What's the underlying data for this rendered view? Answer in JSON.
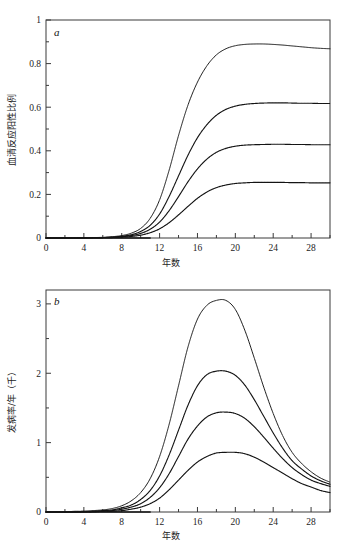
{
  "figure": {
    "panels": [
      {
        "letter": "a",
        "xlabel": "年数",
        "ylabel": "血清反应阳性比例"
      },
      {
        "letter": "b",
        "xlabel": "年数",
        "ylabel": "发病率/年（千）"
      }
    ]
  },
  "chart_data": [
    {
      "type": "line",
      "panel": "a",
      "title": "",
      "xlabel": "年数",
      "ylabel": "血清反应阳性比例",
      "xlim": [
        0,
        30
      ],
      "ylim": [
        0,
        1
      ],
      "xticks": [
        0,
        4,
        8,
        12,
        16,
        20,
        24,
        28
      ],
      "yticks": [
        0,
        0.2,
        0.4,
        0.6,
        0.8,
        1
      ],
      "xtick_labels": [
        "0",
        "4",
        "8",
        "12",
        "16",
        "20",
        "24",
        "28"
      ],
      "ytick_labels": [
        "0",
        "0.2",
        "0.4",
        "0.6",
        "0.8",
        "1"
      ],
      "minor_ticks": true,
      "grid": false,
      "legend": "none",
      "marker_style": "dense-dotted",
      "x": [
        0,
        1,
        2,
        3,
        4,
        5,
        6,
        7,
        8,
        9,
        10,
        11,
        12,
        13,
        14,
        15,
        16,
        17,
        18,
        19,
        20,
        21,
        22,
        23,
        24,
        25,
        26,
        27,
        28,
        29,
        30
      ],
      "series": [
        {
          "name": "curve-1",
          "description": "highest seroprevalence plateau",
          "plateau": 0.89,
          "end_value": 0.87,
          "values": [
            0.0,
            0.0,
            0.0,
            0.0,
            0.001,
            0.002,
            0.003,
            0.006,
            0.011,
            0.022,
            0.044,
            0.09,
            0.175,
            0.31,
            0.47,
            0.61,
            0.715,
            0.79,
            0.84,
            0.868,
            0.882,
            0.888,
            0.89,
            0.89,
            0.888,
            0.885,
            0.881,
            0.877,
            0.873,
            0.87,
            0.868
          ]
        },
        {
          "name": "curve-2",
          "description": "second seroprevalence plateau",
          "plateau": 0.62,
          "end_value": 0.617,
          "values": [
            0.0,
            0.0,
            0.0,
            0.0,
            0.001,
            0.001,
            0.002,
            0.004,
            0.008,
            0.015,
            0.03,
            0.058,
            0.11,
            0.19,
            0.285,
            0.38,
            0.46,
            0.52,
            0.563,
            0.59,
            0.605,
            0.613,
            0.617,
            0.619,
            0.62,
            0.62,
            0.619,
            0.618,
            0.618,
            0.617,
            0.617
          ]
        },
        {
          "name": "curve-3",
          "description": "third seroprevalence plateau",
          "plateau": 0.43,
          "end_value": 0.428,
          "values": [
            0.0,
            0.0,
            0.0,
            0.0,
            0.0,
            0.001,
            0.002,
            0.003,
            0.006,
            0.011,
            0.021,
            0.04,
            0.073,
            0.125,
            0.19,
            0.258,
            0.317,
            0.362,
            0.393,
            0.411,
            0.421,
            0.426,
            0.428,
            0.429,
            0.43,
            0.43,
            0.429,
            0.429,
            0.428,
            0.428,
            0.428
          ]
        },
        {
          "name": "curve-4",
          "description": "lowest seroprevalence plateau",
          "plateau": 0.255,
          "end_value": 0.253,
          "values": [
            0.0,
            0.0,
            0.0,
            0.0,
            0.0,
            0.0,
            0.001,
            0.002,
            0.004,
            0.007,
            0.013,
            0.024,
            0.042,
            0.07,
            0.106,
            0.145,
            0.182,
            0.211,
            0.231,
            0.243,
            0.25,
            0.253,
            0.255,
            0.255,
            0.255,
            0.255,
            0.254,
            0.254,
            0.253,
            0.253,
            0.253
          ]
        }
      ]
    },
    {
      "type": "line",
      "panel": "b",
      "title": "",
      "xlabel": "年数",
      "ylabel": "发病率/年（千）",
      "xlim": [
        0,
        30
      ],
      "ylim": [
        0,
        3.2
      ],
      "xticks": [
        0,
        4,
        8,
        12,
        16,
        20,
        24,
        28
      ],
      "yticks": [
        0,
        1,
        2,
        3
      ],
      "xtick_labels": [
        "0",
        "4",
        "8",
        "12",
        "16",
        "20",
        "24",
        "28"
      ],
      "ytick_labels": [
        "0",
        "1",
        "2",
        "3"
      ],
      "minor_ticks": true,
      "grid": false,
      "legend": "none",
      "marker_style": "dense-dotted",
      "x": [
        0,
        1,
        2,
        3,
        4,
        5,
        6,
        7,
        8,
        9,
        10,
        11,
        12,
        13,
        14,
        15,
        16,
        17,
        18,
        19,
        20,
        21,
        22,
        23,
        24,
        25,
        26,
        27,
        28,
        29,
        30
      ],
      "series": [
        {
          "name": "curve-1",
          "description": "highest incidence peak",
          "peak_value": 3.05,
          "peak_year": 19,
          "end_value": 0.43,
          "values": [
            0.0,
            0.0,
            0.0,
            0.01,
            0.01,
            0.02,
            0.03,
            0.05,
            0.09,
            0.16,
            0.28,
            0.48,
            0.8,
            1.26,
            1.82,
            2.38,
            2.78,
            2.98,
            3.05,
            3.05,
            2.92,
            2.62,
            2.22,
            1.8,
            1.42,
            1.1,
            0.86,
            0.7,
            0.58,
            0.49,
            0.43
          ]
        },
        {
          "name": "curve-2",
          "description": "second incidence peak",
          "peak_value": 2.03,
          "peak_year": 19.5,
          "end_value": 0.4,
          "values": [
            0.0,
            0.0,
            0.0,
            0.0,
            0.01,
            0.01,
            0.02,
            0.03,
            0.06,
            0.1,
            0.18,
            0.31,
            0.52,
            0.82,
            1.18,
            1.54,
            1.82,
            1.98,
            2.03,
            2.03,
            1.97,
            1.83,
            1.62,
            1.38,
            1.14,
            0.92,
            0.74,
            0.62,
            0.52,
            0.45,
            0.4
          ]
        },
        {
          "name": "curve-3",
          "description": "third incidence peak",
          "peak_value": 1.43,
          "peak_year": 20,
          "end_value": 0.37,
          "values": [
            0.0,
            0.0,
            0.0,
            0.0,
            0.0,
            0.01,
            0.01,
            0.02,
            0.04,
            0.07,
            0.12,
            0.21,
            0.35,
            0.55,
            0.8,
            1.05,
            1.24,
            1.37,
            1.43,
            1.44,
            1.42,
            1.35,
            1.23,
            1.08,
            0.92,
            0.77,
            0.64,
            0.54,
            0.46,
            0.41,
            0.37
          ]
        },
        {
          "name": "curve-4",
          "description": "lowest incidence peak",
          "peak_value": 0.86,
          "peak_year": 20.5,
          "end_value": 0.28,
          "values": [
            0.0,
            0.0,
            0.0,
            0.0,
            0.0,
            0.0,
            0.01,
            0.01,
            0.02,
            0.04,
            0.07,
            0.12,
            0.2,
            0.32,
            0.46,
            0.6,
            0.72,
            0.8,
            0.85,
            0.86,
            0.86,
            0.84,
            0.79,
            0.72,
            0.64,
            0.56,
            0.48,
            0.41,
            0.36,
            0.31,
            0.28
          ]
        }
      ]
    }
  ]
}
